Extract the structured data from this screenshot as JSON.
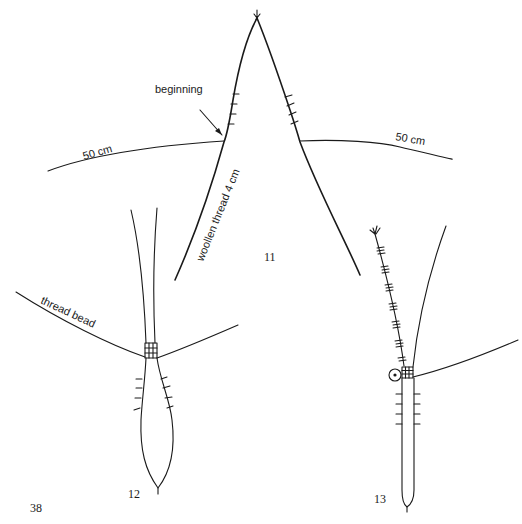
{
  "figure": {
    "page_number": "38",
    "items": [
      {
        "id": "11",
        "label": "11",
        "annotations": {
          "beginning": "beginning",
          "left_length": "50 cm",
          "right_length": "50 cm",
          "thread": "woollen thread 4 cm"
        }
      },
      {
        "id": "12",
        "label": "12",
        "annotations": {
          "thread": "thread bead"
        }
      },
      {
        "id": "13",
        "label": "13"
      }
    ]
  },
  "colors": {
    "ink": "#1a1a1a",
    "background": "#ffffff"
  }
}
